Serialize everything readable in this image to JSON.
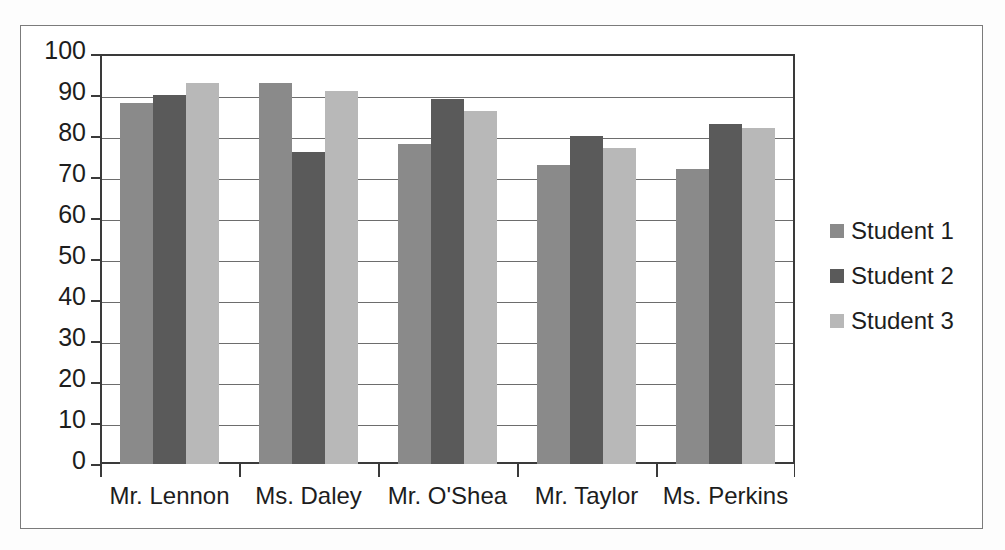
{
  "chart_data": {
    "type": "bar",
    "title": "",
    "subtitle": "",
    "xlabel": "",
    "ylabel": "",
    "ylim": [
      0,
      100
    ],
    "ytick_step": 10,
    "yticks": [
      100,
      90,
      80,
      70,
      60,
      50,
      40,
      30,
      20,
      10,
      0
    ],
    "grid": true,
    "grid_axis": "y",
    "legend_position": "right",
    "categories": [
      "Mr. Lennon",
      "Ms. Daley",
      "Mr. O'Shea",
      "Mr. Taylor",
      "Ms. Perkins"
    ],
    "series": [
      {
        "name": "Student 1",
        "color": "#8a8a8a",
        "values": [
          88,
          93,
          78,
          73,
          72
        ]
      },
      {
        "name": "Student 2",
        "color": "#5a5a5a",
        "values": [
          90,
          76,
          89,
          80,
          83
        ]
      },
      {
        "name": "Student 3",
        "color": "#b8b8b8",
        "values": [
          93,
          91,
          86,
          77,
          82
        ]
      }
    ]
  },
  "style": {
    "frame_color": "#7b7b7b",
    "axis_color": "#3a3a3a",
    "grid_color": "#6d6d6d",
    "text_color": "#1d1d1d",
    "plot_background": "#ffffff"
  },
  "legend": {
    "items": [
      {
        "label": "Student 1",
        "color": "#8a8a8a"
      },
      {
        "label": "Student 2",
        "color": "#5a5a5a"
      },
      {
        "label": "Student 3",
        "color": "#b8b8b8"
      }
    ]
  }
}
